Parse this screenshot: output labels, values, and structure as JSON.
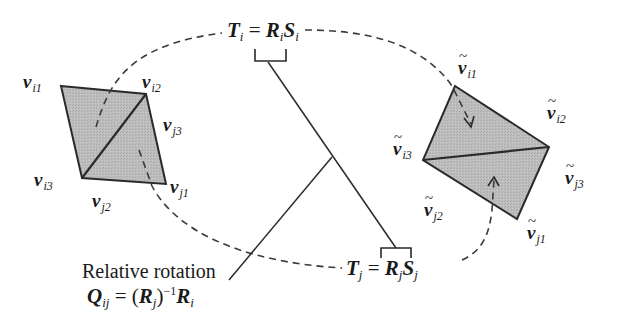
{
  "diagram": {
    "type": "transformation-diagram",
    "left_triangles": {
      "vertices": [
        {
          "id": "vi1",
          "base": "v",
          "sub": "i1",
          "tilde": false
        },
        {
          "id": "vi2",
          "base": "v",
          "sub": "i2",
          "tilde": false
        },
        {
          "id": "vj3",
          "base": "v",
          "sub": "j3",
          "tilde": false
        },
        {
          "id": "vi3",
          "base": "v",
          "sub": "i3",
          "tilde": false
        },
        {
          "id": "vj2",
          "base": "v",
          "sub": "j2",
          "tilde": false
        },
        {
          "id": "vj1",
          "base": "v",
          "sub": "j1",
          "tilde": false
        }
      ],
      "fill_color": "#b8b8b8",
      "stroke_color": "#2a2a2a"
    },
    "right_triangles": {
      "vertices": [
        {
          "id": "tvi1",
          "base": "v",
          "sub": "i1",
          "tilde": true
        },
        {
          "id": "tvi2",
          "base": "v",
          "sub": "i2",
          "tilde": true
        },
        {
          "id": "tvi3",
          "base": "v",
          "sub": "i3",
          "tilde": true
        },
        {
          "id": "tvj3",
          "base": "v",
          "sub": "j3",
          "tilde": true
        },
        {
          "id": "tvj2",
          "base": "v",
          "sub": "j2",
          "tilde": true
        },
        {
          "id": "tvj1",
          "base": "v",
          "sub": "j1",
          "tilde": true
        }
      ],
      "fill_color": "#b8b8b8",
      "stroke_color": "#2a2a2a"
    },
    "transform_i": {
      "lhs": "T",
      "lhs_sub": "i",
      "equals": "=",
      "r": "R",
      "r_sub": "i",
      "s": "S",
      "s_sub": "i"
    },
    "transform_j": {
      "lhs": "T",
      "lhs_sub": "j",
      "equals": "=",
      "r": "R",
      "r_sub": "j",
      "s": "S",
      "s_sub": "j"
    },
    "relative_rotation": {
      "caption": "Relative rotation",
      "q": "Q",
      "q_sub": "ij",
      "equals": "=",
      "open_paren": "(",
      "rj": "R",
      "rj_sub": "j",
      "close_paren": ")",
      "inverse_sup": "−1",
      "ri": "R",
      "ri_sub": "i"
    },
    "colors": {
      "line": "#2a2a2a",
      "dashed": "#3a3a3a",
      "fill": "#b8b8b8"
    }
  }
}
